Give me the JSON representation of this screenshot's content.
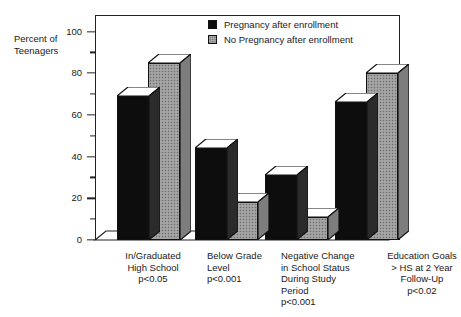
{
  "chart_data": {
    "type": "bar",
    "title": "",
    "subtitle": "",
    "xlabel": "",
    "ylabel": "Percent of\nTeenagers",
    "ylim": [
      0,
      100
    ],
    "ytick_values": [
      0,
      20,
      40,
      60,
      80,
      100
    ],
    "ytick_labels": [
      "0",
      "20",
      "40",
      "60",
      "80",
      "100"
    ],
    "yminor_tick_values": [
      10,
      30,
      50,
      70,
      90
    ],
    "grid": false,
    "legend_position": "top-right-inside",
    "categories": [
      "In/Graduated\nHigh School\np<0.05",
      "Below Grade\nLevel\np<0.001",
      "Negative Change\nin School Status\nDuring Study\nPeriod\np<0.001",
      "Education Goals\n> HS at 2 Year\nFollow-Up\np<0.02"
    ],
    "series": [
      {
        "name": "Pregnancy after enrollment",
        "color": "#0d0d0d",
        "values": [
          69,
          44,
          31,
          66
        ]
      },
      {
        "name": "No Pregnancy after enrollment",
        "color": "#9a9a9a",
        "values": [
          85,
          18,
          11,
          80
        ]
      }
    ]
  },
  "axes": {
    "y_title_line1": "Percent of",
    "y_title_line2": "Teenagers"
  },
  "legend": {
    "items": [
      {
        "label": "Pregnancy after enrollment"
      },
      {
        "label": "No Pregnancy after enrollment"
      }
    ]
  },
  "xgroups": [
    {
      "label": "In/Graduated\nHigh School\np<0.05"
    },
    {
      "label": "Below Grade\nLevel\np<0.001"
    },
    {
      "label": "Negative Change\nin School Status\nDuring Study\nPeriod\np<0.001"
    },
    {
      "label": "Education Goals\n> HS at 2 Year\nFollow-Up\np<0.02"
    }
  ]
}
